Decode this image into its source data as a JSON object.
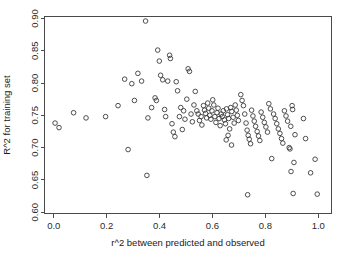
{
  "chart_data": {
    "type": "scatter",
    "title": "",
    "xlabel": "r^2 between predicted and observed",
    "ylabel": "R^2 for training set",
    "xlim": [
      -0.035,
      1.05
    ],
    "ylim": [
      0.598,
      0.903
    ],
    "xticks": [
      0.0,
      0.2,
      0.4,
      0.6,
      0.8,
      1.0
    ],
    "xticklabels": [
      "0.0",
      "0.2",
      "0.4",
      "0.6",
      "0.8",
      "1.0"
    ],
    "yticks": [
      0.6,
      0.65,
      0.7,
      0.75,
      0.8,
      0.85,
      0.9
    ],
    "yticklabels": [
      "0.60",
      "0.65",
      "0.70",
      "0.75",
      "0.80",
      "0.85",
      "0.90"
    ],
    "grid": false,
    "legend": null,
    "marker": "open-circle",
    "marker_color": "#3b3b3b",
    "marker_radius_px": 2.3,
    "n_points": 131,
    "points": [
      [
        0.005,
        0.738
      ],
      [
        0.02,
        0.731
      ],
      [
        0.075,
        0.754
      ],
      [
        0.122,
        0.746
      ],
      [
        0.196,
        0.748
      ],
      [
        0.243,
        0.765
      ],
      [
        0.281,
        0.697
      ],
      [
        0.268,
        0.806
      ],
      [
        0.295,
        0.799
      ],
      [
        0.305,
        0.773
      ],
      [
        0.318,
        0.815
      ],
      [
        0.332,
        0.803
      ],
      [
        0.347,
        0.896
      ],
      [
        0.352,
        0.657
      ],
      [
        0.356,
        0.746
      ],
      [
        0.37,
        0.762
      ],
      [
        0.383,
        0.777
      ],
      [
        0.388,
        0.773
      ],
      [
        0.393,
        0.851
      ],
      [
        0.399,
        0.834
      ],
      [
        0.404,
        0.812
      ],
      [
        0.412,
        0.805
      ],
      [
        0.419,
        0.759
      ],
      [
        0.423,
        0.748
      ],
      [
        0.431,
        0.803
      ],
      [
        0.438,
        0.843
      ],
      [
        0.441,
        0.838
      ],
      [
        0.447,
        0.737
      ],
      [
        0.452,
        0.724
      ],
      [
        0.458,
        0.717
      ],
      [
        0.463,
        0.802
      ],
      [
        0.468,
        0.788
      ],
      [
        0.475,
        0.748
      ],
      [
        0.48,
        0.762
      ],
      [
        0.486,
        0.728
      ],
      [
        0.491,
        0.757
      ],
      [
        0.496,
        0.744
      ],
      [
        0.503,
        0.775
      ],
      [
        0.508,
        0.822
      ],
      [
        0.513,
        0.818
      ],
      [
        0.519,
        0.752
      ],
      [
        0.524,
        0.74
      ],
      [
        0.53,
        0.766
      ],
      [
        0.535,
        0.787
      ],
      [
        0.541,
        0.757
      ],
      [
        0.546,
        0.752
      ],
      [
        0.551,
        0.742
      ],
      [
        0.557,
        0.748
      ],
      [
        0.56,
        0.735
      ],
      [
        0.566,
        0.765
      ],
      [
        0.57,
        0.758
      ],
      [
        0.574,
        0.753
      ],
      [
        0.578,
        0.746
      ],
      [
        0.582,
        0.769
      ],
      [
        0.586,
        0.761
      ],
      [
        0.59,
        0.75
      ],
      [
        0.594,
        0.744
      ],
      [
        0.598,
        0.757
      ],
      [
        0.601,
        0.774
      ],
      [
        0.605,
        0.766
      ],
      [
        0.609,
        0.748
      ],
      [
        0.613,
        0.739
      ],
      [
        0.617,
        0.754
      ],
      [
        0.621,
        0.761
      ],
      [
        0.625,
        0.745
      ],
      [
        0.629,
        0.734
      ],
      [
        0.633,
        0.752
      ],
      [
        0.637,
        0.748
      ],
      [
        0.641,
        0.757
      ],
      [
        0.645,
        0.743
      ],
      [
        0.649,
        0.737
      ],
      [
        0.653,
        0.76
      ],
      [
        0.657,
        0.751
      ],
      [
        0.661,
        0.745
      ],
      [
        0.665,
        0.729
      ],
      [
        0.669,
        0.762
      ],
      [
        0.673,
        0.756
      ],
      [
        0.678,
        0.747
      ],
      [
        0.682,
        0.738
      ],
      [
        0.686,
        0.766
      ],
      [
        0.69,
        0.758
      ],
      [
        0.694,
        0.75
      ],
      [
        0.698,
        0.742
      ],
      [
        0.652,
        0.712
      ],
      [
        0.659,
        0.719
      ],
      [
        0.672,
        0.704
      ],
      [
        0.707,
        0.782
      ],
      [
        0.712,
        0.773
      ],
      [
        0.717,
        0.765
      ],
      [
        0.722,
        0.752
      ],
      [
        0.727,
        0.738
      ],
      [
        0.731,
        0.727
      ],
      [
        0.735,
        0.719
      ],
      [
        0.739,
        0.713
      ],
      [
        0.744,
        0.706
      ],
      [
        0.733,
        0.627
      ],
      [
        0.748,
        0.758
      ],
      [
        0.753,
        0.749
      ],
      [
        0.758,
        0.741
      ],
      [
        0.763,
        0.733
      ],
      [
        0.769,
        0.725
      ],
      [
        0.774,
        0.718
      ],
      [
        0.779,
        0.711
      ],
      [
        0.784,
        0.755
      ],
      [
        0.79,
        0.747
      ],
      [
        0.796,
        0.739
      ],
      [
        0.802,
        0.732
      ],
      [
        0.808,
        0.724
      ],
      [
        0.813,
        0.768
      ],
      [
        0.819,
        0.76
      ],
      [
        0.824,
        0.683
      ],
      [
        0.831,
        0.752
      ],
      [
        0.837,
        0.745
      ],
      [
        0.843,
        0.737
      ],
      [
        0.849,
        0.729
      ],
      [
        0.855,
        0.722
      ],
      [
        0.861,
        0.714
      ],
      [
        0.866,
        0.707
      ],
      [
        0.872,
        0.757
      ],
      [
        0.878,
        0.749
      ],
      [
        0.884,
        0.741
      ],
      [
        0.89,
        0.7
      ],
      [
        0.893,
        0.698
      ],
      [
        0.896,
        0.733
      ],
      [
        0.901,
        0.765
      ],
      [
        0.903,
        0.759
      ],
      [
        0.897,
        0.663
      ],
      [
        0.905,
        0.629
      ],
      [
        0.908,
        0.677
      ],
      [
        0.912,
        0.72
      ],
      [
        0.944,
        0.745
      ],
      [
        0.952,
        0.714
      ],
      [
        0.971,
        0.661
      ],
      [
        0.988,
        0.682
      ],
      [
        0.996,
        0.628
      ]
    ]
  },
  "axes": {
    "x_axis_name": "x-axis",
    "y_axis_name": "y-axis"
  }
}
